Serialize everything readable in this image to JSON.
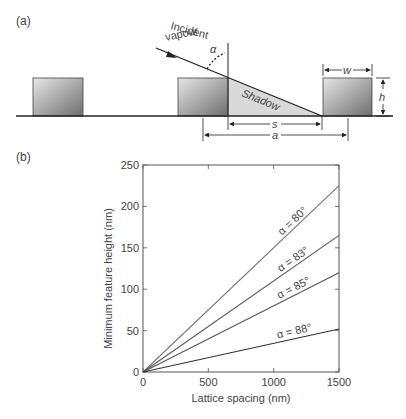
{
  "panel_a": {
    "label": "(a)",
    "incident_line1": "Incident",
    "incident_line2": "vapour",
    "alpha": "α",
    "shadow": "Shadow",
    "dim_w": "w",
    "dim_h": "h",
    "dim_s": "s",
    "dim_a": "a"
  },
  "panel_b": {
    "label": "(b)"
  },
  "chart_data": {
    "type": "line",
    "title": "",
    "xlabel": "Lattice spacing (nm)",
    "ylabel": "Minimum feature height (nm)",
    "xlim": [
      0,
      1500
    ],
    "ylim": [
      0,
      250
    ],
    "xticks": [
      "0",
      "500",
      "1000",
      "1500"
    ],
    "yticks": [
      "0",
      "50",
      "100",
      "150",
      "200",
      "250"
    ],
    "grid": false,
    "legend": "inline labels at line ends",
    "series": [
      {
        "name": "α = 80°",
        "x": [
          0,
          1500
        ],
        "values": [
          0,
          225
        ],
        "color": "#777777"
      },
      {
        "name": "α = 83°",
        "x": [
          0,
          1500
        ],
        "values": [
          0,
          165
        ],
        "color": "#555555"
      },
      {
        "name": "α = 85°",
        "x": [
          0,
          1500
        ],
        "values": [
          0,
          120
        ],
        "color": "#555555"
      },
      {
        "name": "α = 88°",
        "x": [
          0,
          1500
        ],
        "values": [
          0,
          52
        ],
        "color": "#333333"
      }
    ]
  },
  "footer_partial": ""
}
